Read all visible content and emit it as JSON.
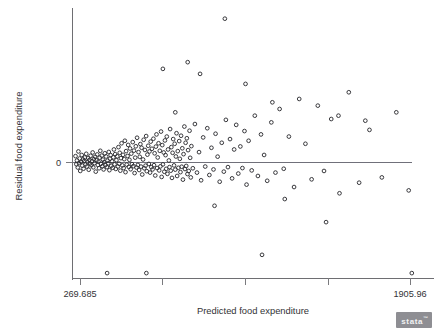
{
  "chart_data": {
    "type": "scatter",
    "title": "",
    "xlabel": "Predicted food expenditure",
    "ylabel": "Residual food expenditure",
    "xlim": [
      269.685,
      1905.96
    ],
    "ylim": [
      -1180,
      900
    ],
    "xticklabels": [
      "269.685",
      "1905.96"
    ],
    "yticklabels": [
      "0"
    ],
    "xtick_values": [
      269.685,
      669.84,
      1069.99,
      1470.14,
      1905.96
    ],
    "ytick_values": [
      0
    ],
    "grid": false,
    "legend": null,
    "annotations": [
      {
        "text": "reference line at residual = 0",
        "y": 0
      }
    ],
    "x_axis_left_label": "269.685",
    "x_axis_right_label": "1905.96",
    "y_zero_label": "0",
    "marker": "open-circle",
    "marker_color": "#2e2e33",
    "point_count": 245,
    "points": [
      [
        277,
        38
      ],
      [
        281,
        -18
      ],
      [
        284,
        12
      ],
      [
        288,
        -52
      ],
      [
        291,
        66
      ],
      [
        294,
        -7
      ],
      [
        297,
        24
      ],
      [
        300,
        -88
      ],
      [
        304,
        4
      ],
      [
        307,
        45
      ],
      [
        310,
        -33
      ],
      [
        313,
        18
      ],
      [
        316,
        -64
      ],
      [
        319,
        9
      ],
      [
        322,
        30
      ],
      [
        325,
        -20
      ],
      [
        329,
        52
      ],
      [
        332,
        -42
      ],
      [
        335,
        2
      ],
      [
        338,
        27
      ],
      [
        341,
        -75
      ],
      [
        344,
        15
      ],
      [
        347,
        -11
      ],
      [
        350,
        40
      ],
      [
        354,
        -29
      ],
      [
        357,
        8
      ],
      [
        360,
        60
      ],
      [
        363,
        -50
      ],
      [
        366,
        21
      ],
      [
        369,
        -6
      ],
      [
        372,
        34
      ],
      [
        375,
        -95
      ],
      [
        379,
        13
      ],
      [
        382,
        48
      ],
      [
        385,
        -25
      ],
      [
        388,
        5
      ],
      [
        391,
        -60
      ],
      [
        394,
        29
      ],
      [
        397,
        70
      ],
      [
        400,
        -14
      ],
      [
        404,
        41
      ],
      [
        407,
        -38
      ],
      [
        410,
        17
      ],
      [
        413,
        -72
      ],
      [
        416,
        3
      ],
      [
        419,
        55
      ],
      [
        422,
        -27
      ],
      [
        425,
        36
      ],
      [
        429,
        -48
      ],
      [
        432,
        11
      ],
      [
        435,
        -9
      ],
      [
        438,
        63
      ],
      [
        441,
        -80
      ],
      [
        444,
        23
      ],
      [
        447,
        44
      ],
      [
        450,
        -35
      ],
      [
        454,
        7
      ],
      [
        457,
        -55
      ],
      [
        460,
        31
      ],
      [
        463,
        78
      ],
      [
        466,
        -19
      ],
      [
        469,
        50
      ],
      [
        472,
        -67
      ],
      [
        475,
        14
      ],
      [
        479,
        37
      ],
      [
        482,
        -42
      ],
      [
        485,
        92
      ],
      [
        488,
        -12
      ],
      [
        491,
        58
      ],
      [
        494,
        -85
      ],
      [
        497,
        26
      ],
      [
        500,
        115
      ],
      [
        504,
        -30
      ],
      [
        507,
        46
      ],
      [
        510,
        -58
      ],
      [
        513,
        20
      ],
      [
        516,
        130
      ],
      [
        519,
        -100
      ],
      [
        522,
        68
      ],
      [
        525,
        -22
      ],
      [
        529,
        39
      ],
      [
        532,
        105
      ],
      [
        535,
        -46
      ],
      [
        538,
        16
      ],
      [
        541,
        84
      ],
      [
        544,
        -70
      ],
      [
        547,
        53
      ],
      [
        550,
        -17
      ],
      [
        554,
        122
      ],
      [
        557,
        -38
      ],
      [
        560,
        71
      ],
      [
        563,
        -110
      ],
      [
        566,
        29
      ],
      [
        569,
        97
      ],
      [
        572,
        -52
      ],
      [
        575,
        148
      ],
      [
        579,
        -25
      ],
      [
        582,
        62
      ],
      [
        585,
        -78
      ],
      [
        588,
        34
      ],
      [
        591,
        110
      ],
      [
        594,
        -43
      ],
      [
        597,
        88
      ],
      [
        600,
        -125
      ],
      [
        604,
        18
      ],
      [
        607,
        136
      ],
      [
        610,
        -60
      ],
      [
        613,
        75
      ],
      [
        616,
        -33
      ],
      [
        619,
        158
      ],
      [
        622,
        -90
      ],
      [
        625,
        47
      ],
      [
        629,
        100
      ],
      [
        632,
        -15
      ],
      [
        635,
        66
      ],
      [
        638,
        -105
      ],
      [
        641,
        125
      ],
      [
        644,
        -48
      ],
      [
        647,
        82
      ],
      [
        650,
        -72
      ],
      [
        654,
        142
      ],
      [
        657,
        -28
      ],
      [
        660,
        55
      ],
      [
        663,
        -135
      ],
      [
        666,
        95
      ],
      [
        669,
        168
      ],
      [
        672,
        -58
      ],
      [
        675,
        30
      ],
      [
        679,
        115
      ],
      [
        682,
        -82
      ],
      [
        685,
        70
      ],
      [
        688,
        -40
      ],
      [
        691,
        185
      ],
      [
        694,
        -150
      ],
      [
        697,
        104
      ],
      [
        700,
        -20
      ],
      [
        704,
        60
      ],
      [
        707,
        -96
      ],
      [
        710,
        132
      ],
      [
        713,
        44
      ],
      [
        716,
        -66
      ],
      [
        719,
        155
      ],
      [
        722,
        -118
      ],
      [
        725,
        78
      ],
      [
        729,
        12
      ],
      [
        732,
        -48
      ],
      [
        735,
        200
      ],
      [
        738,
        -85
      ],
      [
        741,
        92
      ],
      [
        744,
        -160
      ],
      [
        747,
        58
      ],
      [
        750,
        140
      ],
      [
        754,
        -30
      ],
      [
        757,
        112
      ],
      [
        760,
        -74
      ],
      [
        763,
        36
      ],
      [
        766,
        175
      ],
      [
        769,
        -140
      ],
      [
        772,
        68
      ],
      [
        775,
        -55
      ],
      [
        779,
        128
      ],
      [
        782,
        22
      ],
      [
        785,
        -100
      ],
      [
        788,
        160
      ],
      [
        791,
        -44
      ],
      [
        794,
        85
      ],
      [
        797,
        -178
      ],
      [
        800,
        50
      ],
      [
        804,
        215
      ],
      [
        807,
        -68
      ],
      [
        810,
        118
      ],
      [
        813,
        -36
      ],
      [
        816,
        145
      ],
      [
        819,
        -120
      ],
      [
        822,
        74
      ],
      [
        825,
        -88
      ],
      [
        829,
        190
      ],
      [
        832,
        28
      ],
      [
        835,
        -155
      ],
      [
        838,
        98
      ],
      [
        845,
        -60
      ],
      [
        855,
        230
      ],
      [
        865,
        -105
      ],
      [
        875,
        62
      ],
      [
        885,
        -185
      ],
      [
        895,
        150
      ],
      [
        905,
        -42
      ],
      [
        915,
        205
      ],
      [
        925,
        -130
      ],
      [
        935,
        88
      ],
      [
        945,
        -72
      ],
      [
        955,
        172
      ],
      [
        965,
        35
      ],
      [
        975,
        -200
      ],
      [
        985,
        118
      ],
      [
        995,
        -95
      ],
      [
        1005,
        255
      ],
      [
        1015,
        -48
      ],
      [
        1025,
        140
      ],
      [
        1035,
        -165
      ],
      [
        1045,
        78
      ],
      [
        1055,
        225
      ],
      [
        1065,
        -115
      ],
      [
        1075,
        96
      ],
      [
        1085,
        -58
      ],
      [
        1095,
        188
      ],
      [
        1105,
        -230
      ],
      [
        1115,
        130
      ],
      [
        1130,
        -82
      ],
      [
        1145,
        280
      ],
      [
        1160,
        -140
      ],
      [
        1175,
        168
      ],
      [
        1190,
        45
      ],
      [
        1205,
        -190
      ],
      [
        1225,
        240
      ],
      [
        1245,
        -105
      ],
      [
        1265,
        320
      ],
      [
        1285,
        -65
      ],
      [
        1310,
        155
      ],
      [
        1335,
        -255
      ],
      [
        1360,
        380
      ],
      [
        1390,
        112
      ],
      [
        1420,
        -175
      ],
      [
        1450,
        340
      ],
      [
        1480,
        -88
      ],
      [
        1515,
        260
      ],
      [
        1555,
        -320
      ],
      [
        1600,
        420
      ],
      [
        1650,
        -210
      ],
      [
        1700,
        195
      ],
      [
        1760,
        -155
      ],
      [
        1830,
        300
      ],
      [
        1890,
        -290
      ],
      [
        1905,
        -1150
      ],
      [
        620,
        -1150
      ],
      [
        430,
        -1150
      ],
      [
        1180,
        -960
      ],
      [
        1490,
        -620
      ],
      [
        1000,
        860
      ],
      [
        700,
        560
      ],
      [
        880,
        530
      ],
      [
        1230,
        360
      ],
      [
        1100,
        470
      ],
      [
        820,
        600
      ],
      [
        760,
        300
      ],
      [
        1550,
        280
      ],
      [
        1680,
        250
      ],
      [
        950,
        -450
      ],
      [
        1290,
        -380
      ]
    ]
  },
  "branding": {
    "logo_text": "stata",
    "trademark": "™"
  }
}
